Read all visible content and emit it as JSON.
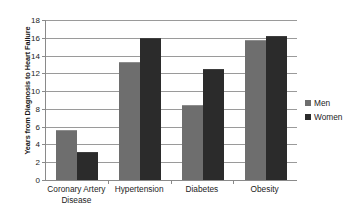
{
  "chart_data": {
    "type": "bar",
    "title": "",
    "xlabel": "",
    "ylabel": "Years from Diagnosis to Heart Failure",
    "ylim": [
      0,
      18
    ],
    "ytick_step": 2,
    "yticks": [
      "0",
      "2",
      "4",
      "6",
      "8",
      "10",
      "12",
      "14",
      "16",
      "18"
    ],
    "grid": true,
    "legend_position": "right",
    "categories": [
      "Coronary Artery Disease",
      "Hypertension",
      "Diabetes",
      "Obesity"
    ],
    "category_lines": [
      [
        "Coronary Artery",
        "Disease"
      ],
      [
        "Hypertension"
      ],
      [
        "Diabetes"
      ],
      [
        "Obesity"
      ]
    ],
    "series": [
      {
        "name": "Men",
        "color": "#6e6e6e",
        "values": [
          5.6,
          13.3,
          8.4,
          15.8
        ]
      },
      {
        "name": "Women",
        "color": "#2b2b2b",
        "values": [
          3.2,
          16.0,
          12.5,
          16.2
        ]
      }
    ]
  },
  "legend": {
    "items": [
      {
        "label": "Men",
        "swatch": "legend-swatch-men"
      },
      {
        "label": "Women",
        "swatch": "legend-swatch-women"
      }
    ]
  }
}
